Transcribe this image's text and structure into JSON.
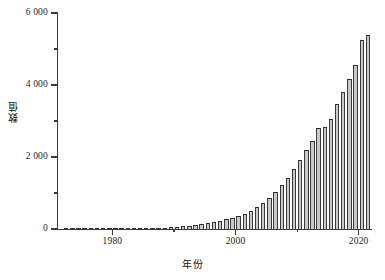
{
  "chart_data": {
    "type": "bar",
    "title": "",
    "subtitle": "",
    "xlabel": "年份",
    "ylabel": "数值",
    "xlim": [
      1971.0,
      2022.0
    ],
    "ylim": [
      0,
      6000
    ],
    "grid": false,
    "legend": null,
    "bar_fill_color": "#c9c9c9",
    "bar_edge_color": "#3a3a3a",
    "axis_color": "#3c3c3c",
    "background_color": "#ffffff",
    "thousands_separator": " ",
    "x_ticks": [
      1980,
      2000,
      2020
    ],
    "x_tick_labels": [
      "1980",
      "2000",
      "2020"
    ],
    "x_minor_ticks": [
      1990,
      2010
    ],
    "y_ticks": [
      0,
      2000,
      4000,
      6000
    ],
    "y_tick_labels": [
      "0",
      "2 000",
      "4 000",
      "6 000"
    ],
    "y_minor_ticks": [
      1000,
      3000,
      5000
    ],
    "categories": [
      1972,
      1973,
      1974,
      1975,
      1976,
      1977,
      1978,
      1979,
      1980,
      1981,
      1982,
      1983,
      1984,
      1985,
      1986,
      1987,
      1988,
      1989,
      1990,
      1991,
      1992,
      1993,
      1994,
      1995,
      1996,
      1997,
      1998,
      1999,
      2000,
      2001,
      2002,
      2003,
      2004,
      2005,
      2006,
      2007,
      2008,
      2009,
      2010,
      2011,
      2012,
      2013,
      2014,
      2015,
      2016,
      2017,
      2018,
      2019,
      2020,
      2021
    ],
    "values": [
      4,
      5,
      6,
      6,
      7,
      8,
      9,
      10,
      12,
      14,
      16,
      18,
      21,
      24,
      28,
      33,
      40,
      48,
      58,
      72,
      88,
      108,
      132,
      160,
      190,
      225,
      265,
      310,
      360,
      420,
      500,
      600,
      720,
      860,
      1030,
      1220,
      1430,
      1680,
      1930,
      2190,
      2450,
      2800,
      2840,
      3060,
      3460,
      3800,
      4160,
      4550,
      5250,
      5400
    ]
  },
  "axis_titles": {
    "y": "数值",
    "x": "年份"
  }
}
